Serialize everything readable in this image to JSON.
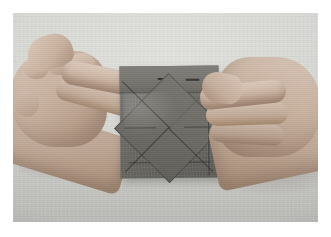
{
  "photo": {
    "caption": "Two hands folding a square of gray origami paper on a light cloth surface",
    "border_color": "#ffffff",
    "background_color": "#d6d6d3",
    "frame": {
      "left": 13,
      "top": 13,
      "width": 305,
      "height": 209
    }
  },
  "subjects": {
    "surface": {
      "name": "cloth-surface",
      "description": "Light gray textured cloth or table surface",
      "color": "#d6d6d3"
    },
    "paper": {
      "name": "origami-paper",
      "description": "Square sheet of gray origami paper, partially folded with diagonal creases forming a central diamond",
      "color": "#6c6b65",
      "shadow_color": "#50504e",
      "fold_lines": [
        "top horizontal band fold",
        "diagonal crease upper-left to center",
        "diagonal crease upper-right to center",
        "diagonal crease lower-left to center",
        "diagonal crease lower-right to center"
      ]
    },
    "left_hand": {
      "name": "left-hand",
      "description": "Left hand with index finger extended, pressing the top-left corner of the paper",
      "skin_color": "#c6ae9c"
    },
    "right_hand": {
      "name": "right-hand",
      "description": "Right hand with index finger extended, pressing the right edge of the paper",
      "skin_color": "#c5ad9b"
    }
  }
}
